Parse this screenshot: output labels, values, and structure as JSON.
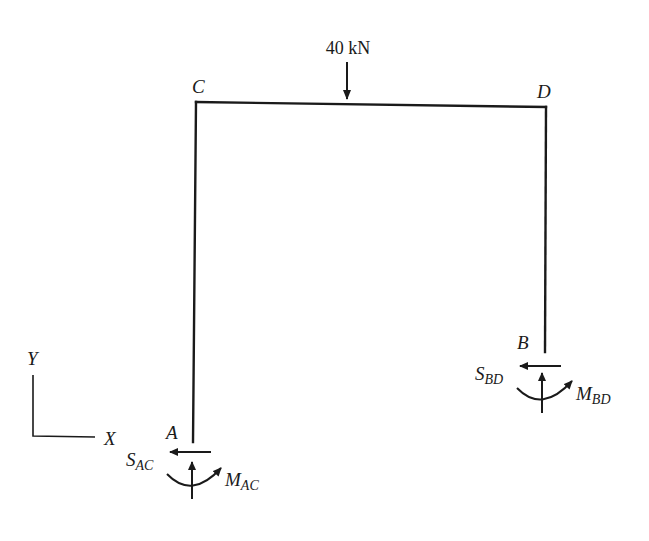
{
  "figure": {
    "type": "frame free-body diagram",
    "load": {
      "label": "40 kN",
      "direction": "down"
    },
    "joints": {
      "top_left": "C",
      "top_right": "D",
      "base_left": "A",
      "base_right": "B"
    },
    "reactions": {
      "left": {
        "shear_main": "S",
        "shear_sub": "AC",
        "moment_main": "M",
        "moment_sub": "AC"
      },
      "right": {
        "shear_main": "S",
        "shear_sub": "BD",
        "moment_main": "M",
        "moment_sub": "BD"
      }
    },
    "axes": {
      "x": "X",
      "y": "Y"
    },
    "colors": {
      "ink": "#1a1a1a",
      "background": "#ffffff"
    }
  }
}
